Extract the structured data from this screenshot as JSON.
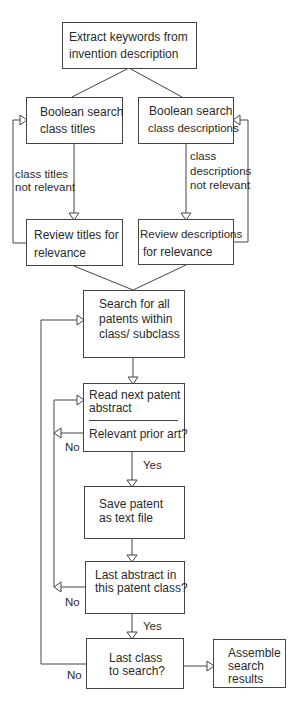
{
  "diagram": {
    "type": "flowchart",
    "nodes": {
      "extract": {
        "line1": "Extract keywords from",
        "line2": "invention description"
      },
      "bool_titles": {
        "line1": "Boolean search",
        "line2": "class titles"
      },
      "bool_desc": {
        "line1": "Boolean search",
        "line2": "class descriptions"
      },
      "review_titles": {
        "line1": "Review titles for",
        "line2": "relevance"
      },
      "review_desc": {
        "line1": "Review descriptions",
        "line2": "for relevance"
      },
      "search_all": {
        "line1": "Search for all",
        "line2": "patents within",
        "line3": "class/ subclass"
      },
      "read_next": {
        "line1": "Read next patent",
        "line2": "abstract",
        "question": "Relevant prior art?"
      },
      "save_patent": {
        "line1": "Save patent",
        "line2": "as text file"
      },
      "last_abstract": {
        "line1": "Last abstract in",
        "line2": "this patent class?"
      },
      "last_class": {
        "line1": "Last class",
        "line2": "to search?"
      },
      "assemble": {
        "line1": "Assemble",
        "line2": "search",
        "line3": "results"
      }
    },
    "edge_labels": {
      "titles_not_relevant_1": "class titles",
      "titles_not_relevant_2": "not relevant",
      "desc_not_relevant_1": "class",
      "desc_not_relevant_2": "descriptions",
      "desc_not_relevant_3": "not relevant",
      "relevant_no": "No",
      "relevant_yes": "Yes",
      "last_abstract_no": "No",
      "last_abstract_yes": "Yes",
      "last_class_no": "No"
    },
    "edges": [
      {
        "from": "extract",
        "to": "bool_titles"
      },
      {
        "from": "extract",
        "to": "bool_desc"
      },
      {
        "from": "bool_titles",
        "to": "review_titles",
        "label": "class titles not relevant"
      },
      {
        "from": "review_titles",
        "to": "bool_titles"
      },
      {
        "from": "bool_desc",
        "to": "review_desc",
        "label": "class descriptions not relevant"
      },
      {
        "from": "review_desc",
        "to": "bool_desc"
      },
      {
        "from": "review_titles",
        "to": "search_all"
      },
      {
        "from": "review_desc",
        "to": "search_all"
      },
      {
        "from": "search_all",
        "to": "read_next"
      },
      {
        "from": "read_next",
        "to": "save_patent",
        "label": "Yes"
      },
      {
        "from": "read_next",
        "to": "read_next",
        "label": "No"
      },
      {
        "from": "save_patent",
        "to": "last_abstract"
      },
      {
        "from": "last_abstract",
        "to": "read_next",
        "label": "No"
      },
      {
        "from": "last_abstract",
        "to": "last_class",
        "label": "Yes"
      },
      {
        "from": "last_class",
        "to": "search_all",
        "label": "No"
      },
      {
        "from": "last_class",
        "to": "assemble"
      }
    ],
    "colors": {
      "line": "#444444",
      "text": "#2a2a2a",
      "background": "#ffffff"
    }
  }
}
